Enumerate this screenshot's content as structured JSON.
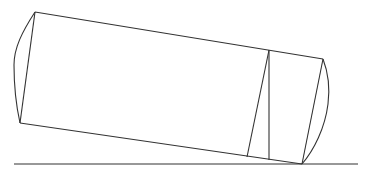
{
  "diagram": {
    "stroke_color": "#333333",
    "background": "#ffffff",
    "ground_line": {
      "x1": 14,
      "y1": 164,
      "x2": 358,
      "y2": 164
    },
    "cylinder": {
      "top_left": [
        35,
        12
      ],
      "bottom_left": [
        20,
        123
      ],
      "top_right": [
        323,
        59
      ],
      "bottom_right": [
        302,
        164
      ],
      "left_cap_bulge": [
        14,
        65
      ],
      "right_cap_bulge": [
        329,
        96
      ]
    },
    "inner_lines": {
      "vertical": {
        "x1": 269,
        "y1": 50,
        "x2": 269,
        "y2": 160
      },
      "slanted": {
        "x1": 269,
        "y1": 50,
        "x2": 247,
        "y2": 157
      }
    }
  }
}
